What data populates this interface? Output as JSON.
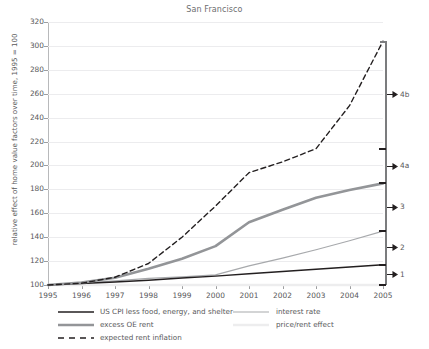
{
  "chart_data": {
    "type": "line",
    "title": "San Francisco",
    "xlabel": "",
    "ylabel": "relative effect of home value factors over time, 1995 = 100",
    "x": [
      1995,
      1996,
      1997,
      1998,
      1999,
      2000,
      2001,
      2002,
      2003,
      2004,
      2005
    ],
    "xlim": [
      1995,
      2005
    ],
    "ylim": [
      100,
      320
    ],
    "yticks": [
      100,
      120,
      140,
      160,
      180,
      200,
      220,
      240,
      260,
      280,
      300,
      320
    ],
    "xticks": [
      "1995",
      "1996",
      "1997",
      "1998",
      "1999",
      "2000",
      "2001",
      "2002",
      "2003",
      "2004",
      "2005"
    ],
    "grid": true,
    "legend_position": "bottom",
    "series": [
      {
        "name": "US CPI less food, energy, and shelter",
        "color": "#231f20",
        "style": "solid",
        "width": 1.4,
        "values": [
          100,
          101.2,
          102.5,
          104.0,
          105.8,
          107.4,
          109.4,
          111.3,
          113.2,
          115.1,
          117.0
        ]
      },
      {
        "name": "interest rate",
        "color": "#a7a9ac",
        "style": "solid",
        "width": 1.2,
        "values": [
          100,
          101.5,
          103.5,
          105.5,
          106.8,
          108.5,
          116.0,
          122.5,
          129.5,
          137.0,
          145.0
        ]
      },
      {
        "name": "excess OE rent",
        "color": "#939598",
        "style": "solid",
        "width": 2.6,
        "values": [
          100,
          102.0,
          106.0,
          113.5,
          122.0,
          132.5,
          152.5,
          163.0,
          173.0,
          179.5,
          185.0
        ]
      },
      {
        "name": "price/rent effect",
        "color": "#ededee",
        "style": "solid",
        "width": 2.6,
        "values": [
          100,
          100,
          100,
          100,
          100,
          100,
          100,
          100,
          100,
          100,
          100
        ]
      },
      {
        "name": "expected rent inflation",
        "color": "#231f20",
        "style": "dashed",
        "width": 1.4,
        "values": [
          100,
          101.5,
          106.5,
          118.0,
          140.0,
          166.0,
          194.0,
          203.0,
          214.0,
          250.0,
          304.0
        ]
      }
    ],
    "annotations": [
      {
        "label": "4b",
        "from": 214,
        "to": 304
      },
      {
        "label": "4a",
        "from": 185,
        "to": 214
      },
      {
        "label": "3",
        "from": 145,
        "to": 185
      },
      {
        "label": "2",
        "from": 117,
        "to": 145
      },
      {
        "label": "1",
        "from": 100,
        "to": 117
      }
    ]
  },
  "legend": {
    "items": [
      {
        "label": "US CPI less food, energy, and shelter"
      },
      {
        "label": "interest rate"
      },
      {
        "label": "excess OE rent"
      },
      {
        "label": "price/rent effect"
      },
      {
        "label": "expected rent inflation"
      }
    ]
  }
}
